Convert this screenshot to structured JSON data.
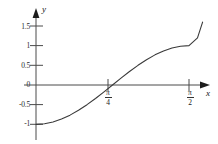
{
  "chart_data": {
    "type": "line",
    "title": "",
    "xlabel": "x",
    "ylabel": "y",
    "xlim": [
      0,
      1.736
    ],
    "ylim": [
      -1.15,
      1.75
    ],
    "grid": false,
    "legend": null,
    "y_ticks": [
      {
        "value": 1.5,
        "label": "1.5"
      },
      {
        "value": 1.0,
        "label": "1"
      },
      {
        "value": 0.5,
        "label": "0.5"
      },
      {
        "value": 0.0,
        "label": "0"
      },
      {
        "value": -0.5,
        "label": "-0.5"
      },
      {
        "value": -1.0,
        "label": "-1"
      }
    ],
    "x_ticks": [
      {
        "value": 0.7854,
        "num": "π",
        "den": "4"
      },
      {
        "value": 1.5708,
        "num": "π",
        "den": "2"
      }
    ],
    "series": [
      {
        "name": "curve",
        "color": "#3a3a3a",
        "x": [
          0.0,
          0.0873,
          0.1745,
          0.2618,
          0.3491,
          0.4363,
          0.5236,
          0.6109,
          0.6981,
          0.7854,
          0.8727,
          0.9599,
          1.0472,
          1.1345,
          1.2217,
          1.309,
          1.3963,
          1.4835,
          1.5708,
          1.6581,
          1.7104
        ],
        "y": [
          -1.0,
          -0.9848,
          -0.9397,
          -0.866,
          -0.766,
          -0.6428,
          -0.5,
          -0.342,
          -0.1736,
          0.0,
          0.1736,
          0.342,
          0.5,
          0.6428,
          0.766,
          0.866,
          0.9397,
          0.9848,
          1.0,
          1.2,
          1.6
        ]
      }
    ]
  },
  "axes": {
    "y_axis_name": "y",
    "x_axis_name": "x"
  }
}
